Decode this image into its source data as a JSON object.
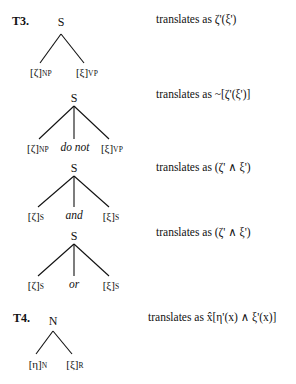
{
  "sections": [
    {
      "label": "T3.",
      "trees": [
        {
          "root": "S",
          "leaves": [
            {
              "bracket": "[ζ]",
              "sub": "NP"
            },
            {
              "bracket": "[ξ]",
              "sub": "VP"
            }
          ],
          "translation": "translates as ζ'(ξ')"
        },
        {
          "root": "S",
          "leaves": [
            {
              "bracket": "[ζ]",
              "sub": "NP"
            },
            {
              "word": "do not"
            },
            {
              "bracket": "[ξ]",
              "sub": "VP"
            }
          ],
          "translation": "translates as ~[ζ'(ξ')]"
        },
        {
          "root": "S",
          "leaves": [
            {
              "bracket": "[ζ]",
              "sub": "S"
            },
            {
              "word": "and"
            },
            {
              "bracket": "[ξ]",
              "sub": "S"
            }
          ],
          "translation": "translates as (ζ' ∧ ξ')"
        },
        {
          "root": "S",
          "leaves": [
            {
              "bracket": "[ζ]",
              "sub": "S"
            },
            {
              "word": "or"
            },
            {
              "bracket": "[ξ]",
              "sub": "S"
            }
          ],
          "translation": "translates as (ζ' ∧ ξ')"
        }
      ]
    },
    {
      "label": "T4.",
      "trees": [
        {
          "root": "N",
          "leaves": [
            {
              "bracket": "[η]",
              "sub": "N"
            },
            {
              "bracket": "[ξ]",
              "sub": "R"
            }
          ],
          "translation": "translates as x̂[η'(x) ∧  ξ'(x)]"
        }
      ]
    }
  ]
}
